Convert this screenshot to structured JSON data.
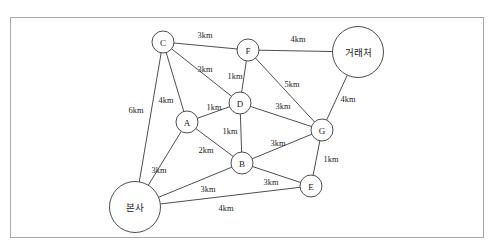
{
  "figure": {
    "caption_fragment": "",
    "frame_color": "#a8a8a8",
    "background_color": "#ffffff",
    "line_color": "#3a3a3a"
  },
  "chart_data": {
    "type": "diagram",
    "title": "",
    "unit": "km",
    "nodes": [
      {
        "id": "C",
        "label": "C",
        "x": 163,
        "y": 42,
        "r": 11,
        "shape": "circle"
      },
      {
        "id": "F",
        "label": "F",
        "x": 248,
        "y": 50,
        "r": 11,
        "shape": "circle"
      },
      {
        "id": "CLIENT",
        "label": "거래처",
        "x": 358,
        "y": 52,
        "r": 25.5,
        "shape": "circle"
      },
      {
        "id": "D",
        "label": "D",
        "x": 240,
        "y": 103,
        "r": 11,
        "shape": "circle"
      },
      {
        "id": "A",
        "label": "A",
        "x": 187,
        "y": 122,
        "r": 11,
        "shape": "circle"
      },
      {
        "id": "G",
        "label": "G",
        "x": 322,
        "y": 130,
        "r": 11,
        "shape": "circle"
      },
      {
        "id": "B",
        "label": "B",
        "x": 242,
        "y": 163,
        "r": 11,
        "shape": "circle"
      },
      {
        "id": "E",
        "label": "E",
        "x": 311,
        "y": 186,
        "r": 11,
        "shape": "circle"
      },
      {
        "id": "HQ",
        "label": "본사",
        "x": 135,
        "y": 207,
        "r": 25.5,
        "shape": "circle"
      }
    ],
    "edges": [
      {
        "from": "C",
        "to": "F",
        "weight": 3,
        "label": "3km",
        "lx": 205,
        "ly": 35
      },
      {
        "from": "F",
        "to": "CLIENT",
        "weight": 4,
        "label": "4km",
        "lx": 298,
        "ly": 39
      },
      {
        "from": "C",
        "to": "D",
        "weight": 3,
        "label": "3km",
        "lx": 205,
        "ly": 69
      },
      {
        "from": "F",
        "to": "D",
        "weight": 1,
        "label": "1km",
        "lx": 235,
        "ly": 76
      },
      {
        "from": "F",
        "to": "G",
        "weight": 5,
        "label": "5km",
        "lx": 292,
        "ly": 84
      },
      {
        "from": "CLIENT",
        "to": "G",
        "weight": 4,
        "label": "4km",
        "lx": 348,
        "ly": 99
      },
      {
        "from": "C",
        "to": "A",
        "weight": 4,
        "label": "4km",
        "lx": 166,
        "ly": 100
      },
      {
        "from": "C",
        "to": "HQ",
        "weight": 6,
        "label": "6km",
        "lx": 136,
        "ly": 110
      },
      {
        "from": "A",
        "to": "D",
        "weight": 1,
        "label": "1km",
        "lx": 214,
        "ly": 107
      },
      {
        "from": "D",
        "to": "G",
        "weight": 3,
        "label": "3km",
        "lx": 283,
        "ly": 106
      },
      {
        "from": "D",
        "to": "B",
        "weight": 1,
        "label": "1km",
        "lx": 230,
        "ly": 131
      },
      {
        "from": "A",
        "to": "B",
        "weight": 2,
        "label": "2km",
        "lx": 206,
        "ly": 150
      },
      {
        "from": "A",
        "to": "HQ",
        "weight": 3,
        "label": "3km",
        "lx": 159,
        "ly": 170
      },
      {
        "from": "B",
        "to": "G",
        "weight": 3,
        "label": "3km",
        "lx": 278,
        "ly": 143
      },
      {
        "from": "G",
        "to": "E",
        "weight": 1,
        "label": "1km",
        "lx": 331,
        "ly": 159
      },
      {
        "from": "B",
        "to": "E",
        "weight": 3,
        "label": "3km",
        "lx": 271,
        "ly": 182
      },
      {
        "from": "HQ",
        "to": "B",
        "weight": 3,
        "label": "3km",
        "lx": 208,
        "ly": 189
      },
      {
        "from": "HQ",
        "to": "E",
        "weight": 4,
        "label": "4km",
        "lx": 226,
        "ly": 208
      }
    ]
  }
}
